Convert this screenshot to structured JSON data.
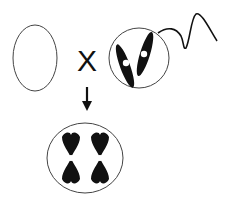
{
  "diagram": {
    "type": "fertilization",
    "elements": [
      {
        "id": "egg",
        "label": "",
        "chromosomes": 0
      },
      {
        "id": "cross",
        "symbol": "X"
      },
      {
        "id": "sperm",
        "chromosomes": 2,
        "has_tail": true
      },
      {
        "id": "arrow",
        "direction": "down"
      },
      {
        "id": "zygote",
        "chromosomes": 2,
        "chromosome_form": "duplicated"
      }
    ],
    "cross_symbol": "X",
    "colors": {
      "stroke": "#333333",
      "fill": "#111111",
      "background": "#ffffff"
    }
  }
}
